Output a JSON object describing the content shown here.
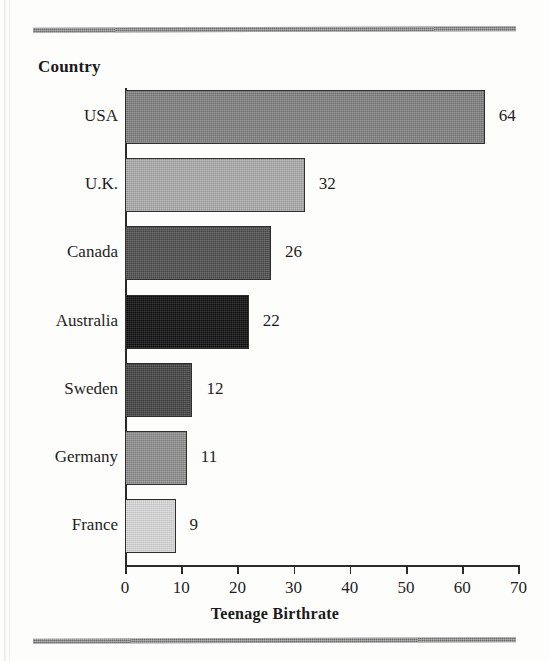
{
  "figure": {
    "category_axis_header": "Country",
    "x_axis_title": "Teenage Birthrate"
  },
  "chart_data": {
    "type": "bar",
    "orientation": "horizontal",
    "title": "",
    "xlabel": "Teenage Birthrate",
    "ylabel": "Country",
    "categories": [
      "USA",
      "U.K.",
      "Canada",
      "Australia",
      "Sweden",
      "Germany",
      "France"
    ],
    "values": [
      64,
      32,
      26,
      22,
      12,
      11,
      9
    ],
    "value_labels": [
      "64",
      "32",
      "26",
      "22",
      "12",
      "11",
      "9"
    ],
    "xlim": [
      0,
      70
    ],
    "xticks": [
      0,
      10,
      20,
      30,
      40,
      50,
      60,
      70
    ],
    "xtick_labels": [
      "0",
      "10",
      "20",
      "30",
      "40",
      "50",
      "60",
      "70"
    ],
    "grid": false,
    "legend": "none",
    "bar_colors": [
      "#7d7d7d",
      "#a9a9a9",
      "#4a4a4a",
      "#080808",
      "#3f3f3f",
      "#8c8c8c",
      "#d9d9d9"
    ],
    "series": [
      {
        "name": "Teenage Birthrate",
        "values": [
          64,
          32,
          26,
          22,
          12,
          11,
          9
        ]
      }
    ]
  }
}
